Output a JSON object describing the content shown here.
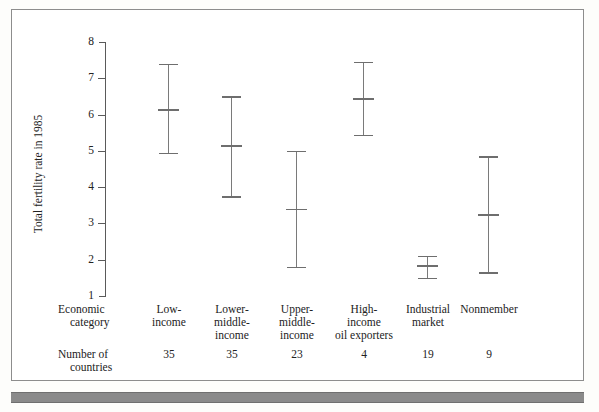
{
  "figure": {
    "axis_title": "Total fertility rate in 1985",
    "row_labels": {
      "category_line1": "Economic",
      "category_line2": "category",
      "count_line1": "Number of",
      "count_line2": "countries"
    }
  },
  "chart_data": {
    "type": "errorbar",
    "title": "",
    "xlabel": "Economic category",
    "ylabel": "Total fertility rate in 1985",
    "ylim": [
      1,
      8
    ],
    "yticks": [
      1,
      2,
      3,
      4,
      5,
      6,
      7,
      8
    ],
    "grid": false,
    "legend": "none",
    "categories": [
      "Low-income",
      "Lower-middle-income",
      "Upper-middle-income",
      "High-income oil exporters",
      "Industrial market",
      "Nonmember"
    ],
    "category_label_lines": [
      [
        "Low-",
        "income"
      ],
      [
        "Lower-",
        "middle-",
        "income"
      ],
      [
        "Upper-",
        "middle-",
        "income"
      ],
      [
        "High-",
        "income",
        "oil exporters"
      ],
      [
        "Industrial",
        "market"
      ],
      [
        "Nonmember"
      ]
    ],
    "series": [
      {
        "name": "upper",
        "values": [
          7.4,
          6.5,
          5.0,
          7.45,
          2.1,
          4.85
        ]
      },
      {
        "name": "mean",
        "values": [
          6.15,
          5.15,
          3.4,
          6.45,
          1.85,
          3.25
        ]
      },
      {
        "name": "lower",
        "values": [
          4.95,
          3.75,
          1.8,
          5.45,
          1.5,
          1.65
        ]
      }
    ],
    "number_of_countries": [
      35,
      35,
      23,
      4,
      19,
      9
    ],
    "tick_labels_y": [
      "1",
      "2",
      "3",
      "4",
      "5",
      "6",
      "7",
      "8"
    ],
    "counts_text": [
      "35",
      "35",
      "23",
      "4",
      "19",
      "9"
    ]
  },
  "colors": {
    "frame": "#8d8d8d",
    "axis": "#5a5a5a",
    "errorbar": "#7a7a7a",
    "band": "#8a8a8a",
    "text": "#222222",
    "background": "#ffffff"
  }
}
